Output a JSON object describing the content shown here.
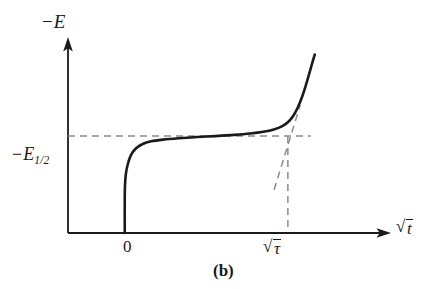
{
  "figure": {
    "caption": "(b)",
    "background_color": "#ffffff",
    "ink_color": "#1a1a1a",
    "dash_color": "#8c8c8c"
  },
  "axes": {
    "y_title_minus": "−",
    "y_title_symbol": "E",
    "x_title_radicand": "t",
    "x_title_prefix": "√",
    "origin_label": "0"
  },
  "annotations": {
    "half_wave_minus": "−",
    "half_wave_symbol": "E",
    "half_wave_subscript": "1/2",
    "transition_time_prefix": "√",
    "transition_time_radicand": "τ"
  },
  "chart_data": {
    "type": "line",
    "title": "(b)",
    "xlabel": "√t",
    "ylabel": "−E",
    "xlim": [
      0,
      1.22
    ],
    "ylim": [
      0,
      1.0
    ],
    "grid": false,
    "legend": null,
    "axis_arrows": {
      "x": true,
      "y": true
    },
    "tick_labels": {
      "x": [
        "0",
        "√τ"
      ],
      "y": [
        "−E₁₂"
      ]
    },
    "series": [
      {
        "name": "chronopotentiogram",
        "style": "solid",
        "linewidth": 2.6,
        "comment": "E rises sharply at t=0, plateaus at E_1/2, then rises steeply near the transition time tau",
        "points": [
          [
            0.215,
            0.0
          ],
          [
            0.215,
            0.18
          ],
          [
            0.216,
            0.245
          ],
          [
            0.219,
            0.3
          ],
          [
            0.226,
            0.35
          ],
          [
            0.238,
            0.398
          ],
          [
            0.256,
            0.432
          ],
          [
            0.281,
            0.455
          ],
          [
            0.315,
            0.47
          ],
          [
            0.36,
            0.479
          ],
          [
            0.42,
            0.486
          ],
          [
            0.49,
            0.492
          ],
          [
            0.56,
            0.497
          ],
          [
            0.63,
            0.503
          ],
          [
            0.69,
            0.51
          ],
          [
            0.74,
            0.519
          ],
          [
            0.78,
            0.531
          ],
          [
            0.812,
            0.548
          ],
          [
            0.836,
            0.572
          ],
          [
            0.855,
            0.604
          ],
          [
            0.871,
            0.645
          ],
          [
            0.886,
            0.695
          ],
          [
            0.9,
            0.752
          ],
          [
            0.913,
            0.812
          ],
          [
            0.925,
            0.87
          ],
          [
            0.935,
            0.915
          ]
        ]
      }
    ],
    "reference_lines": [
      {
        "name": "half-wave-level",
        "orientation": "horizontal",
        "style": "dashed",
        "y": 0.497,
        "x_from": 0.0,
        "x_to": 0.92,
        "label": "−E1/2"
      },
      {
        "name": "transition-time-marker",
        "orientation": "vertical",
        "style": "dashed",
        "x": 0.833,
        "y_from": 0.0,
        "y_to": 0.497,
        "label": "√τ"
      },
      {
        "name": "inflection-tangent",
        "orientation": "oblique",
        "style": "dashed",
        "from": [
          0.781,
          0.222
        ],
        "to": [
          0.88,
          0.656
        ]
      }
    ]
  }
}
